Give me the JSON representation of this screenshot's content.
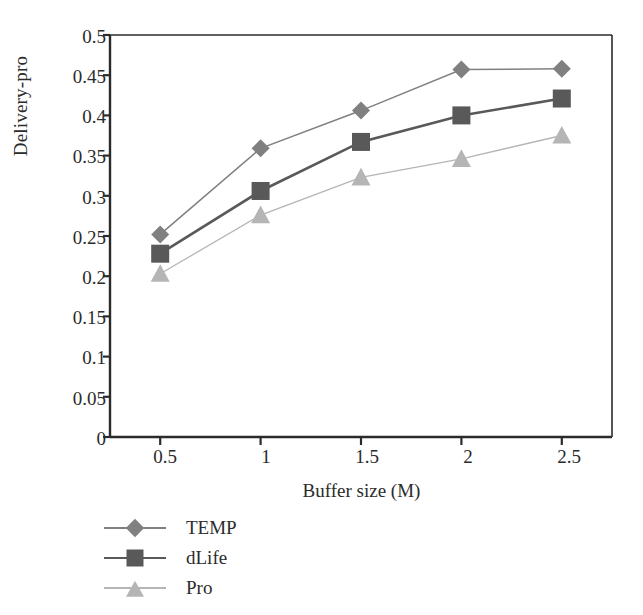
{
  "chart_data": {
    "type": "line",
    "title": "",
    "xlabel": "Buffer size (M)",
    "ylabel": "Delivery-pro",
    "x": [
      0.5,
      1,
      1.5,
      2,
      2.5
    ],
    "xtick_labels": [
      "0.5",
      "1",
      "1.5",
      "2",
      "2.5"
    ],
    "ytick_labels": [
      "0",
      "0.05",
      "0.1",
      "0.15",
      "0.2",
      "0.25",
      "0.3",
      "0.35",
      "0.4",
      "0.45",
      "0.5"
    ],
    "ytick_values": [
      0,
      0.05,
      0.1,
      0.15,
      0.2,
      0.25,
      0.3,
      0.35,
      0.4,
      0.45,
      0.5
    ],
    "xlim": [
      0.25,
      2.75
    ],
    "ylim": [
      0,
      0.5
    ],
    "grid": false,
    "legend_position": "below-left",
    "series": [
      {
        "name": "TEMP",
        "marker": "diamond",
        "color": "#808080",
        "values": [
          0.252,
          0.359,
          0.406,
          0.457,
          0.458
        ]
      },
      {
        "name": "dLife",
        "marker": "square",
        "color": "#595959",
        "values": [
          0.228,
          0.306,
          0.367,
          0.4,
          0.421
        ]
      },
      {
        "name": "Pro",
        "marker": "triangle",
        "color": "#b5b5b5",
        "values": [
          0.203,
          0.276,
          0.323,
          0.346,
          0.375
        ]
      }
    ]
  },
  "axes": {
    "ylabel": "Delivery-pro",
    "xlabel": "Buffer size (M)"
  },
  "legend": {
    "items": [
      {
        "label": "TEMP"
      },
      {
        "label": "dLife"
      },
      {
        "label": "Pro"
      }
    ]
  },
  "ticks": {
    "y": [
      "0.5",
      "0.45",
      "0.4",
      "0.35",
      "0.3",
      "0.25",
      "0.2",
      "0.15",
      "0.1",
      "0.05",
      "0"
    ],
    "x": [
      "0.5",
      "1",
      "1.5",
      "2",
      "2.5"
    ]
  },
  "colors": {
    "temp": "#808080",
    "dlife": "#595959",
    "pro": "#b5b5b5",
    "axis": "#2b2b2b"
  }
}
